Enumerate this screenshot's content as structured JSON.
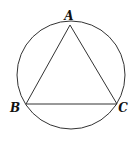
{
  "diagram": {
    "type": "inscribed-triangle-in-circle",
    "stroke_color": "#333333",
    "circle": {
      "cx": 71,
      "cy": 75,
      "r": 54
    },
    "vertices": [
      {
        "name": "A",
        "x": 70,
        "y": 25,
        "label_x": 69,
        "label_y": 20
      },
      {
        "name": "B",
        "x": 26,
        "y": 104,
        "label_x": 14,
        "label_y": 112
      },
      {
        "name": "C",
        "x": 117,
        "y": 104,
        "label_x": 120,
        "label_y": 112
      }
    ],
    "labels": {
      "a": "A",
      "b": "B",
      "c": "C"
    }
  }
}
